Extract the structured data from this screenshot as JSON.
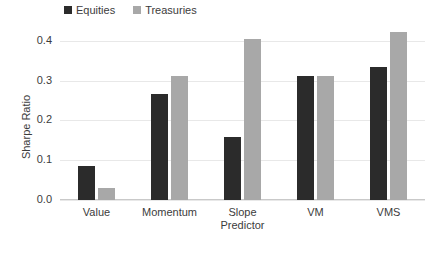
{
  "chart_data": {
    "type": "bar",
    "title": "",
    "xlabel": "",
    "ylabel": "Sharpe Ratio",
    "ylim": [
      0.0,
      0.44
    ],
    "yticks": [
      "0.0",
      "0.1",
      "0.2",
      "0.3",
      "0.4"
    ],
    "ytick_values": [
      0.0,
      0.1,
      0.2,
      0.3,
      0.4
    ],
    "grid": "horizontal",
    "legend_position": "top-left",
    "categories": [
      "Value",
      "Momentum",
      "Slope\nPredictor",
      "VM",
      "VMS"
    ],
    "series": [
      {
        "name": "Equities",
        "color": "#2b2b2b",
        "values": [
          0.085,
          0.267,
          0.158,
          0.312,
          0.334
        ]
      },
      {
        "name": "Treasuries",
        "color": "#a8a8a8",
        "values": [
          0.03,
          0.311,
          0.404,
          0.313,
          0.422
        ]
      }
    ]
  },
  "legend": {
    "entries": [
      {
        "label": "Equities"
      },
      {
        "label": "Treasuries"
      }
    ]
  },
  "axes": {
    "y_title": "Sharpe Ratio"
  }
}
